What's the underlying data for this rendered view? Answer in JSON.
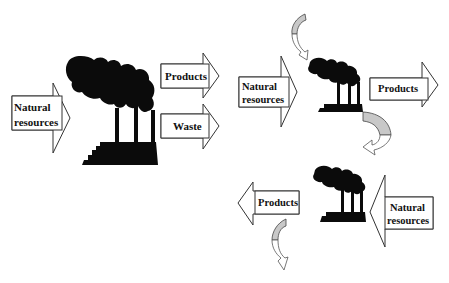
{
  "diagram": {
    "left_system": {
      "input_label_line1": "Natural",
      "input_label_line2": "resources",
      "output_products": "Products",
      "output_waste": "Waste"
    },
    "cycle_system": {
      "top_input_line1": "Natural",
      "top_input_line2": "resources",
      "top_output": "Products",
      "bottom_input_line1": "Natural",
      "bottom_input_line2": "resources",
      "bottom_output": "Products"
    },
    "icons": [
      "factory-icon",
      "factory-icon",
      "factory-icon",
      "curved-arrow-icon",
      "curved-arrow-icon",
      "curved-arrow-icon"
    ],
    "colors": {
      "ink": "#0b0b0b",
      "arrow_outline": "#333333",
      "curved_arrow_fill": "#c8c8c8",
      "background": "#ffffff"
    }
  }
}
